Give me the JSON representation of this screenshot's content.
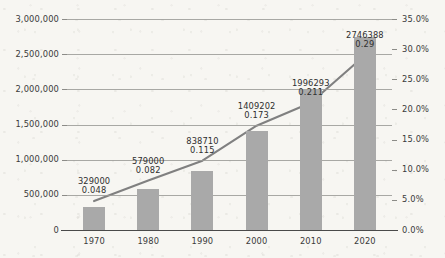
{
  "chart_data": {
    "type": "bar",
    "title": "",
    "subtitle": "",
    "xlabel": "",
    "ylabel": "",
    "categories": [
      "1970",
      "1980",
      "1990",
      "2000",
      "2010",
      "2020"
    ],
    "series": [
      {
        "name": "Count",
        "type": "bar",
        "axis": "left",
        "values": [
          329000,
          579000,
          838710,
          1409202,
          1996293,
          2746388
        ],
        "value_labels": [
          "329000",
          "579000",
          "838710",
          "1409202",
          "1996293",
          "2746388"
        ],
        "color": "#a9a9a9"
      },
      {
        "name": "Share",
        "type": "line",
        "axis": "right",
        "values": [
          0.048,
          0.082,
          0.115,
          0.173,
          0.211,
          0.29
        ],
        "value_labels": [
          "0.048",
          "0.082",
          "0.115",
          "0.173",
          "0.211",
          "0.29"
        ],
        "color": "#808080"
      }
    ],
    "left_axis": {
      "ticks": [
        "0",
        "500,000",
        "1,000,000",
        "1,500,000",
        "2,000,000",
        "2,500,000",
        "3,000,000"
      ],
      "tick_values": [
        0,
        500000,
        1000000,
        1500000,
        2000000,
        2500000,
        3000000
      ],
      "ylim": [
        0,
        3000000
      ]
    },
    "right_axis": {
      "ticks": [
        "0.0%",
        "5.0%",
        "10.0%",
        "15.0%",
        "20.0%",
        "25.0%",
        "30.0%",
        "35.0%"
      ],
      "tick_values": [
        0,
        5,
        10,
        15,
        20,
        25,
        30,
        35
      ],
      "ylim": [
        0,
        35
      ]
    },
    "grid": true,
    "legend": "none",
    "background_color": "#f7f6f2"
  }
}
